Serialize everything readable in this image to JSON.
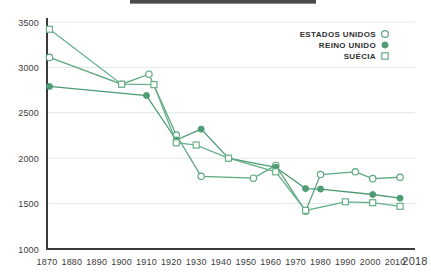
{
  "chart_data": {
    "type": "line",
    "title": "",
    "xlabel": "",
    "ylabel": "",
    "xlim": [
      1870,
      2018
    ],
    "ylim": [
      1000,
      3500
    ],
    "grid": true,
    "legend_position": "top-right",
    "y_ticks": [
      "1000",
      "1500",
      "2000",
      "2500",
      "3000",
      "3500"
    ],
    "y_tick_values": [
      1000,
      1500,
      2000,
      2500,
      3000,
      3500
    ],
    "x_ticks": [
      "1870",
      "1880",
      "1890",
      "1900",
      "1910",
      "1920",
      "1930",
      "1940",
      "1950",
      "1960",
      "1970",
      "1980",
      "1990",
      "2000",
      "2010",
      "2018"
    ],
    "x_tick_values": [
      1870,
      1880,
      1890,
      1900,
      1910,
      1920,
      1930,
      1940,
      1950,
      1960,
      1970,
      1980,
      1990,
      2000,
      2010,
      2018
    ],
    "series": [
      {
        "name": "ESTADOS UNIDOS",
        "marker": "open-circle",
        "color": "#5ea77f",
        "x": [
          1871,
          1900,
          1911,
          1922,
          1932,
          1953,
          1962,
          1974,
          1980,
          1994,
          2001,
          2012
        ],
        "values": [
          3110,
          2815,
          2925,
          2255,
          1800,
          1780,
          1920,
          1415,
          1820,
          1850,
          1775,
          1790
        ]
      },
      {
        "name": "REINO UNIDO",
        "marker": "filled-circle",
        "color": "#4d9c74",
        "x": [
          1871,
          1910,
          1922,
          1932,
          1943,
          1962,
          1974,
          1980,
          2001,
          2012
        ],
        "values": [
          2790,
          2690,
          2200,
          2320,
          2000,
          1900,
          1665,
          1660,
          1600,
          1560
        ]
      },
      {
        "name": "SUÉCIA",
        "marker": "open-square",
        "color": "#67b08a",
        "x": [
          1871,
          1900,
          1913,
          1922,
          1930,
          1943,
          1962,
          1974,
          1990,
          2001,
          2012
        ],
        "values": [
          3420,
          2815,
          2810,
          2170,
          2145,
          2000,
          1850,
          1425,
          1520,
          1510,
          1470
        ]
      }
    ]
  },
  "legend": {
    "items": [
      {
        "label": "ESTADOS UNIDOS",
        "marker": "open-circle"
      },
      {
        "label": "REINO UNIDO",
        "marker": "filled-circle"
      },
      {
        "label": "SUÉCIA",
        "marker": "open-square"
      }
    ]
  },
  "colors": {
    "accent": "#5ea77f",
    "grid": "#dce9e4",
    "axis": "#3a3a3a",
    "text": "#3c3c3c"
  }
}
